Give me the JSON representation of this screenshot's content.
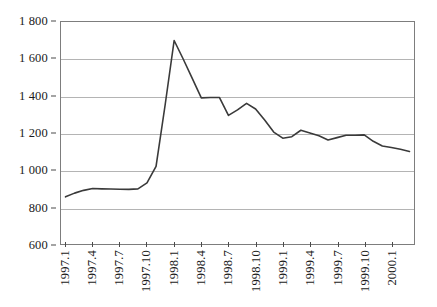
{
  "chart_data": {
    "type": "line",
    "title": "",
    "subtitle": "",
    "xlabel": "",
    "ylabel": "",
    "ylim": [
      600,
      1800
    ],
    "ytick_values": [
      1800,
      1600,
      1400,
      1200,
      1000,
      800,
      600
    ],
    "ytick_labels": [
      "1 800",
      "1 600",
      "1 400",
      "1 200",
      "1 000",
      "800",
      "600"
    ],
    "xtick_labels": [
      "1997.1",
      "1997.4",
      "1997.7",
      "1997.10",
      "1998.1",
      "1998.4",
      "1998.7",
      "1998.10",
      "1999.1",
      "1999.4",
      "1999.7",
      "1999.10",
      "2000.1"
    ],
    "xtick_interval_months": 3,
    "grid": true,
    "legend": "none",
    "line_color": "#3a3a3a",
    "grid_color": "#b4b4b4",
    "frame_color": "#7d7d7d",
    "background": "#ffffff",
    "x": [
      "1997.1",
      "1997.2",
      "1997.3",
      "1997.4",
      "1997.5",
      "1997.6",
      "1997.7",
      "1997.8",
      "1997.9",
      "1997.10",
      "1997.11",
      "1997.12",
      "1998.1",
      "1998.2",
      "1998.3",
      "1998.4",
      "1998.5",
      "1998.6",
      "1998.7",
      "1998.8",
      "1998.9",
      "1998.10",
      "1998.11",
      "1998.12",
      "1999.1",
      "1999.2",
      "1999.3",
      "1999.4",
      "1999.5",
      "1999.6",
      "1999.7",
      "1999.8",
      "1999.9",
      "1999.10",
      "1999.11",
      "1999.12",
      "2000.1",
      "2000.2",
      "2000.3"
    ],
    "series": [
      {
        "name": "series-1",
        "values": [
          855,
          875,
          890,
          900,
          898,
          897,
          896,
          895,
          898,
          930,
          1020,
          1350,
          1700,
          1600,
          1495,
          1390,
          1392,
          1392,
          1295,
          1325,
          1360,
          1330,
          1270,
          1205,
          1172,
          1180,
          1215,
          1200,
          1185,
          1162,
          1175,
          1188,
          1188,
          1190,
          1155,
          1130,
          1122,
          1112,
          1100
        ]
      }
    ]
  }
}
